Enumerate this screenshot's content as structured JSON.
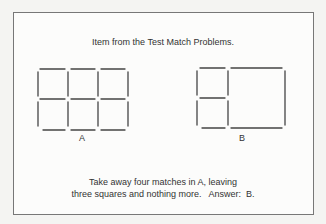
{
  "figure": {
    "title": "Item from the Test Match Problems.",
    "label_a": "A",
    "label_b": "B",
    "caption_line1": "Take away four matches in A, leaving",
    "caption_line2": "three squares and nothing more.   Answer:  B.",
    "colors": {
      "match": "#444444",
      "frame": "#777777"
    }
  },
  "diagram_data": {
    "A": {
      "description": "3x2 grid of squares made of 17 matches"
    },
    "B": {
      "description": "A after removing four matches: two small squares stacked on left, one large square on right"
    }
  }
}
